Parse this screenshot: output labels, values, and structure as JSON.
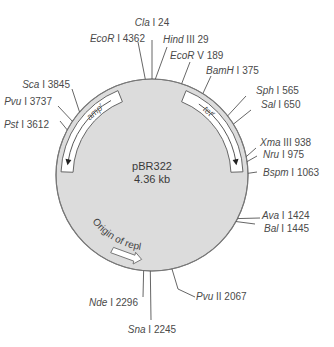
{
  "plasmid": {
    "name": "pBR322",
    "size": "4.36 kb",
    "total_bp": 4361
  },
  "colors": {
    "backbone_fill": "#dcdcdc",
    "backbone_stroke": "#777777",
    "line": "#555555",
    "text": "#4a4a4a"
  },
  "genes": [
    {
      "name": "amp",
      "superscript": "r",
      "start": 3293,
      "end": 4153,
      "direction": "counterclockwise"
    },
    {
      "name": "tet",
      "superscript": "r",
      "start": 86,
      "end": 1276,
      "direction": "clockwise"
    }
  ],
  "origin": {
    "label": "Origin of replication",
    "position": 2535
  },
  "sites": [
    {
      "enzyme": "Cla",
      "numeral": "I",
      "pos": 24
    },
    {
      "enzyme": "Hind",
      "numeral": "III",
      "pos": 29
    },
    {
      "enzyme": "EcoR",
      "numeral": "V",
      "pos": 189
    },
    {
      "enzyme": "BamH",
      "numeral": "I",
      "pos": 375
    },
    {
      "enzyme": "Sph",
      "numeral": "I",
      "pos": 565
    },
    {
      "enzyme": "Sal",
      "numeral": "I",
      "pos": 650
    },
    {
      "enzyme": "Xma",
      "numeral": "III",
      "pos": 938
    },
    {
      "enzyme": "Nru",
      "numeral": "I",
      "pos": 975
    },
    {
      "enzyme": "Bspm",
      "numeral": "I",
      "pos": 1063
    },
    {
      "enzyme": "Ava",
      "numeral": "I",
      "pos": 1424
    },
    {
      "enzyme": "Bal",
      "numeral": "I",
      "pos": 1445
    },
    {
      "enzyme": "Pvu",
      "numeral": "II",
      "pos": 2067
    },
    {
      "enzyme": "Sna",
      "numeral": "I",
      "pos": 2245
    },
    {
      "enzyme": "Nde",
      "numeral": "I",
      "pos": 2296
    },
    {
      "enzyme": "Pst",
      "numeral": "I",
      "pos": 3612
    },
    {
      "enzyme": "Pvu",
      "numeral": "I",
      "pos": 3737
    },
    {
      "enzyme": "Sca",
      "numeral": "I",
      "pos": 3845
    },
    {
      "enzyme": "EcoR",
      "numeral": "I",
      "pos": 4362
    }
  ]
}
